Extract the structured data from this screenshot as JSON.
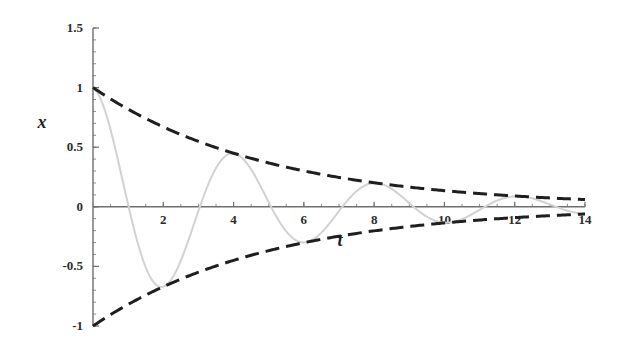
{
  "chart_data": {
    "type": "line",
    "title": "",
    "subtitle": "",
    "xlabel": "t",
    "ylabel": "x",
    "xlim": [
      0,
      14
    ],
    "ylim": [
      -1,
      1.5
    ],
    "grid": false,
    "legend_position": "none",
    "x_ticks": [
      "2",
      "4",
      "6",
      "8",
      "10",
      "12",
      "14"
    ],
    "x_tick_values": [
      2,
      4,
      6,
      8,
      10,
      12,
      14
    ],
    "x_minor_tick_step": 0.5,
    "y_ticks": [
      "1.5",
      "1",
      "0.5",
      "0",
      "-0.5",
      "-1"
    ],
    "y_tick_values": [
      1.5,
      1,
      0.5,
      0,
      -0.5,
      -1
    ],
    "y_minor_tick_step": 0.1,
    "axis_color": "#6e6e6e",
    "series": [
      {
        "name": "damped oscillation",
        "role": "solution",
        "style": "solid",
        "color": "#d2d2d2",
        "width": 2,
        "formula": "x = exp(-0.2 t) cos(1.55 t)",
        "decay_rate": 0.2,
        "angular_frequency": 1.55,
        "amplitude": 1.0,
        "x": [
          0,
          0.5,
          1,
          1.5,
          2,
          2.5,
          3,
          3.2,
          3.5,
          4,
          4.5,
          5,
          5.5,
          6,
          6.4,
          7,
          7.5,
          8,
          8.5,
          9,
          9.5,
          10,
          10.5,
          11,
          11.5,
          12,
          12.5,
          13,
          13.5,
          14
        ],
        "values": [
          1.0,
          0.63,
          0.017,
          -0.6,
          -0.62,
          -0.3,
          0.13,
          0.27,
          0.43,
          0.41,
          0.13,
          -0.22,
          -0.33,
          -0.21,
          0.02,
          0.2,
          0.21,
          0.08,
          -0.09,
          -0.16,
          -0.12,
          0.0,
          0.1,
          0.13,
          0.07,
          -0.03,
          -0.09,
          -0.09,
          -0.03,
          0.03
        ]
      },
      {
        "name": "upper envelope",
        "role": "envelope",
        "style": "dashed",
        "color": "#1f1f1f",
        "width": 3,
        "dash_length": 14,
        "gap_length": 7,
        "formula": "x = exp(-0.2 t)",
        "x": [
          0,
          1,
          2,
          3,
          4,
          5,
          6,
          7,
          8,
          9,
          10,
          11,
          12,
          13,
          14
        ],
        "values": [
          1.0,
          0.819,
          0.67,
          0.549,
          0.449,
          0.368,
          0.301,
          0.247,
          0.202,
          0.165,
          0.135,
          0.111,
          0.091,
          0.074,
          0.061
        ]
      },
      {
        "name": "lower envelope",
        "role": "envelope",
        "style": "dashed",
        "color": "#1f1f1f",
        "width": 3,
        "dash_length": 14,
        "gap_length": 7,
        "formula": "x = -exp(-0.2 t)",
        "x": [
          0,
          1,
          2,
          3,
          4,
          5,
          6,
          7,
          8,
          9,
          10,
          11,
          12,
          13,
          14
        ],
        "values": [
          -1.0,
          -0.819,
          -0.67,
          -0.549,
          -0.449,
          -0.368,
          -0.301,
          -0.247,
          -0.202,
          -0.165,
          -0.135,
          -0.111,
          -0.091,
          -0.074,
          -0.061
        ]
      }
    ]
  },
  "labels": {
    "x_axis_title": "t",
    "y_axis_title": "x"
  }
}
